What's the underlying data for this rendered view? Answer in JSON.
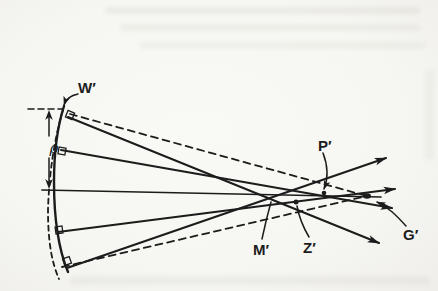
{
  "figure": {
    "kind": "scanned-optics-diagram",
    "labels": {
      "wavefront": "W′",
      "semi_aperture": "ρ",
      "p_point": "P′",
      "marginal_focus": "M′",
      "zonal_point": "Z′",
      "gaussian_point": "G′"
    },
    "colors": {
      "ink": "#1c1c1c",
      "paper": "#f6f6f2"
    }
  }
}
